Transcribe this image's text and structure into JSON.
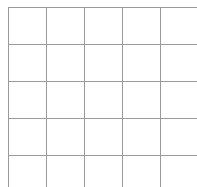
{
  "grid": {
    "line_color": "#9a9a9a",
    "columns": 5,
    "rows": 5,
    "vertical_lines_x": [
      8,
      46,
      84,
      122,
      160
    ],
    "horizontal_lines_y": [
      7,
      44,
      81,
      118,
      155
    ]
  }
}
